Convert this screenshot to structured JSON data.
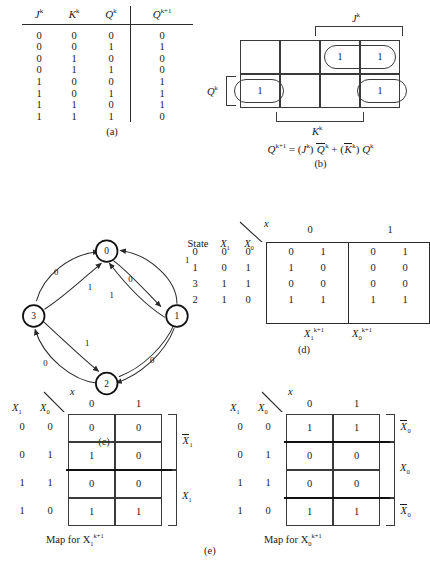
{
  "panel_a": {
    "caption": "(a)",
    "headers": [
      "J",
      "K",
      "Q",
      "Q"
    ],
    "header_sups": [
      "k",
      "k",
      "k",
      "k+1"
    ],
    "rows": [
      [
        "0",
        "0",
        "0",
        "0"
      ],
      [
        "0",
        "0",
        "1",
        "1"
      ],
      [
        "0",
        "1",
        "0",
        "0"
      ],
      [
        "0",
        "1",
        "1",
        "0"
      ],
      [
        "1",
        "0",
        "0",
        "1"
      ],
      [
        "1",
        "0",
        "1",
        "1"
      ],
      [
        "1",
        "1",
        "0",
        "1"
      ],
      [
        "1",
        "1",
        "1",
        "0"
      ]
    ]
  },
  "panel_b": {
    "caption": "(b)",
    "grid_rows": 2,
    "grid_cols": 4,
    "cells": [
      [
        "",
        "",
        "1",
        "1"
      ],
      [
        "1",
        "",
        "",
        "1"
      ]
    ],
    "bracket_top_label": "J",
    "bracket_top_sup": "k",
    "bracket_bottom_label": "K",
    "bracket_bottom_sup": "k",
    "bracket_left_label": "Q",
    "bracket_left_sup": "k",
    "equation": {
      "lhs": "Q",
      "lhs_sup": "k+1",
      "text": "= (J k ) Q̄ k + ( K̄ k ) Q k",
      "parts": [
        "Q",
        "k+1",
        "=",
        "(",
        "J",
        "k",
        ")",
        "Q",
        "k",
        "+",
        "(",
        "K",
        "k",
        ")",
        "Q",
        "k"
      ]
    }
  },
  "panel_c": {
    "caption": "(c)",
    "nodes": [
      {
        "id": "0",
        "label": "0",
        "x": 148,
        "y": 30
      },
      {
        "id": "1",
        "label": "1",
        "x": 258,
        "y": 120
      },
      {
        "id": "2",
        "label": "2",
        "x": 148,
        "y": 212
      },
      {
        "id": "3",
        "label": "3",
        "x": 38,
        "y": 120
      }
    ],
    "edges": [
      {
        "from": "3",
        "to": "0",
        "label": "0"
      },
      {
        "from": "0",
        "to": "1",
        "label": "0"
      },
      {
        "from": "1",
        "to": "0",
        "label": "1"
      },
      {
        "from": "3",
        "to": "0",
        "label": "1"
      },
      {
        "from": "1",
        "to": "0",
        "label": "1"
      },
      {
        "from": "0",
        "to": "1",
        "label": "1"
      },
      {
        "from": "3",
        "to": "2",
        "label": "1"
      },
      {
        "from": "2",
        "to": "3",
        "label": "0"
      },
      {
        "from": "1",
        "to": "2",
        "label": "0"
      },
      {
        "from": "2",
        "to": "1",
        "label": "0"
      }
    ],
    "edge_labels": [
      "0",
      "1",
      "0",
      "1",
      "1",
      "1",
      "0",
      "0"
    ]
  },
  "panel_d": {
    "caption": "(d)",
    "corner_input_label": "x",
    "col_header_state": "State",
    "col_header_x1": "X",
    "col_header_x1_sub": "1",
    "col_header_x0": "X",
    "col_header_x0_sub": "0",
    "x_values": [
      "0",
      "1"
    ],
    "rows": [
      {
        "state": "0",
        "x1": "0",
        "x0": "0",
        "x0col": [
          "0",
          "1"
        ],
        "x1col": [
          "0",
          "1"
        ]
      },
      {
        "state": "1",
        "x1": "0",
        "x0": "1",
        "x0col": [
          "1",
          "0"
        ],
        "x1col": [
          "0",
          "0"
        ]
      },
      {
        "state": "3",
        "x1": "1",
        "x0": "1",
        "x0col": [
          "0",
          "0"
        ],
        "x1col": [
          "0",
          "0"
        ]
      },
      {
        "state": "2",
        "x1": "1",
        "x0": "0",
        "x0col": [
          "1",
          "1"
        ],
        "x1col": [
          "1",
          "1"
        ]
      }
    ],
    "bottom_label_1": "X",
    "bottom_label_1_sub": "1",
    "bottom_label_1_sup": "k+1",
    "bottom_label_0": "X",
    "bottom_label_0_sub": "0",
    "bottom_label_0_sup": "k+1"
  },
  "panel_e": {
    "caption": "(e)",
    "maps": [
      {
        "name": "map-x1",
        "corner_input_label": "x",
        "row_var_left": "X",
        "row_var_left_sub": "1",
        "row_var_right": "X",
        "row_var_right_sub": "0",
        "col_labels": [
          "0",
          "1"
        ],
        "row_labels": [
          [
            "0",
            "0"
          ],
          [
            "0",
            "1"
          ],
          [
            "1",
            "1"
          ],
          [
            "1",
            "0"
          ]
        ],
        "cells": [
          [
            "0",
            "0"
          ],
          [
            "1",
            "0"
          ],
          [
            "0",
            "0"
          ],
          [
            "1",
            "1"
          ]
        ],
        "groups": [
          {
            "label": "X",
            "sub": "1",
            "overbar": true,
            "rows": [
              0,
              1
            ]
          },
          {
            "label": "X",
            "sub": "1",
            "overbar": false,
            "rows": [
              2,
              3
            ]
          }
        ],
        "caption": "Map for X",
        "caption_sub": "1",
        "caption_sup": "k+1"
      },
      {
        "name": "map-x0",
        "corner_input_label": "x",
        "row_var_left": "X",
        "row_var_left_sub": "1",
        "row_var_right": "X",
        "row_var_right_sub": "0",
        "col_labels": [
          "0",
          "1"
        ],
        "row_labels": [
          [
            "0",
            "0"
          ],
          [
            "0",
            "1"
          ],
          [
            "1",
            "1"
          ],
          [
            "1",
            "0"
          ]
        ],
        "cells": [
          [
            "1",
            "1"
          ],
          [
            "0",
            "0"
          ],
          [
            "0",
            "0"
          ],
          [
            "1",
            "1"
          ]
        ],
        "groups": [
          {
            "label": "X",
            "sub": "0",
            "overbar": true,
            "rows": [
              0
            ]
          },
          {
            "label": "X",
            "sub": "0",
            "overbar": false,
            "rows": [
              1,
              2
            ]
          },
          {
            "label": "X",
            "sub": "0",
            "overbar": true,
            "rows": [
              3
            ]
          }
        ],
        "caption": "Map for X",
        "caption_sub": "0",
        "caption_sup": "k+1"
      }
    ]
  },
  "colors": {
    "ink": "#1a1a1a",
    "line": "#3a3a3a",
    "rule": "#2b2b2b",
    "background": "#ffffff"
  }
}
